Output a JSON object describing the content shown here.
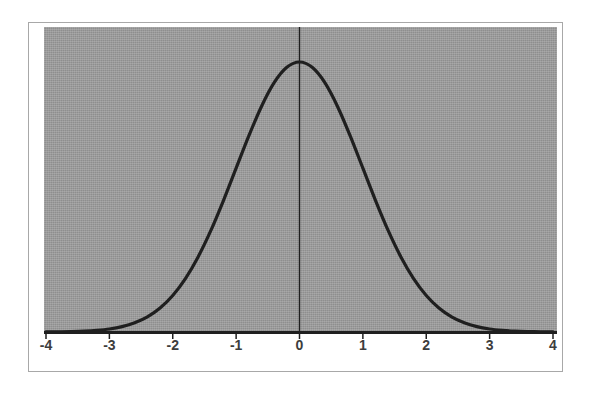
{
  "figure": {
    "background_color": "#ffffff",
    "frame_color": "#a8a8a8",
    "plot_background_color": "#9a9a9a",
    "curve_color": "#1f1f1f",
    "axis_color": "#1f1f1f",
    "label_color": "#3d3d3d"
  },
  "chart_data": {
    "type": "line",
    "title": "",
    "subtitle": "",
    "xlabel": "",
    "ylabel": "",
    "xlim": [
      -4,
      4
    ],
    "ylim": [
      0,
      0.4
    ],
    "grid": false,
    "legend": null,
    "legend_position": "none",
    "xticks": [
      -4,
      -3,
      -2,
      -1,
      0,
      1,
      2,
      3,
      4
    ],
    "xticklabels": [
      "-4",
      "-3",
      "-2",
      "-1",
      "0",
      "1",
      "2",
      "3",
      "4"
    ],
    "yticks": [],
    "yticklabels": [],
    "annotations": [
      {
        "name": "mean-reference-line",
        "type": "vline",
        "x": 0,
        "label": ""
      }
    ],
    "series": [
      {
        "name": "Standard normal density",
        "distribution": "normal",
        "mean": 0,
        "std_dev": 1,
        "peak_value": 0.3989,
        "x": [
          -4.0,
          -3.8,
          -3.6,
          -3.4,
          -3.2,
          -3.0,
          -2.8,
          -2.6,
          -2.4,
          -2.2,
          -2.0,
          -1.8,
          -1.6,
          -1.4,
          -1.2,
          -1.0,
          -0.8,
          -0.6,
          -0.4,
          -0.2,
          0.0,
          0.2,
          0.4,
          0.6,
          0.8,
          1.0,
          1.2,
          1.4,
          1.6,
          1.8,
          2.0,
          2.2,
          2.4,
          2.6,
          2.8,
          3.0,
          3.2,
          3.4,
          3.6,
          3.8,
          4.0
        ],
        "values": [
          0.0001,
          0.0003,
          0.0006,
          0.0012,
          0.0024,
          0.0044,
          0.0079,
          0.0136,
          0.0224,
          0.0355,
          0.054,
          0.079,
          0.1109,
          0.1497,
          0.1942,
          0.242,
          0.2897,
          0.3332,
          0.3683,
          0.391,
          0.3989,
          0.391,
          0.3683,
          0.3332,
          0.2897,
          0.242,
          0.1942,
          0.1497,
          0.1109,
          0.079,
          0.054,
          0.0355,
          0.0224,
          0.0136,
          0.0079,
          0.0044,
          0.0024,
          0.0012,
          0.0006,
          0.0003,
          0.0001
        ]
      }
    ]
  }
}
